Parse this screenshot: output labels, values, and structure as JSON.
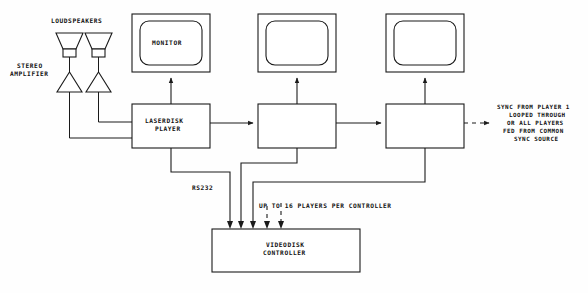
{
  "diagram": {
    "background_color": "#fefefe",
    "line_color": "#1a1a1a",
    "labels": {
      "loudspeakers": "LOUDSPEAKERS",
      "stereo_amplifier_line1": "STEREO",
      "stereo_amplifier_line2": "AMPLIFIER",
      "monitor": "MONITOR",
      "laserdisk_player_line1": "LASERDISK",
      "laserdisk_player_line2": "PLAYER",
      "videodisk_controller_line1": "VIDEODISK",
      "videodisk_controller_line2": "CONTROLLER",
      "rs232": "RS232",
      "players_per_controller": "UP TO 16 PLAYERS PER CONTROLLER",
      "sync_note_line1": "SYNC FROM PLAYER 1",
      "sync_note_line2": "LOOPED THROUGH",
      "sync_note_line3": "OR ALL PLAYERS",
      "sync_note_line4": "FED FROM COMMON",
      "sync_note_line5": "SYNC SOURCE"
    },
    "nodes": {
      "monitor_1": {
        "label": "MONITOR",
        "x": 132,
        "y": 14,
        "w": 78,
        "h": 58
      },
      "monitor_2": {
        "label": "",
        "x": 258,
        "y": 14,
        "w": 78,
        "h": 58
      },
      "monitor_3": {
        "label": "",
        "x": 386,
        "y": 14,
        "w": 78,
        "h": 58
      },
      "player_1": {
        "label": "LASERDISK PLAYER",
        "x": 132,
        "y": 104,
        "w": 78,
        "h": 44
      },
      "player_2": {
        "label": "",
        "x": 258,
        "y": 104,
        "w": 78,
        "h": 44
      },
      "player_3": {
        "label": "",
        "x": 386,
        "y": 104,
        "w": 78,
        "h": 44
      },
      "controller": {
        "label": "VIDEODISK CONTROLLER",
        "x": 212,
        "y": 229,
        "w": 148,
        "h": 43
      },
      "speaker_left": {
        "label": "loudspeaker",
        "x": 63,
        "y": 27
      },
      "speaker_right": {
        "label": "loudspeaker",
        "x": 92,
        "y": 27
      },
      "amp_left": {
        "label": "amplifier",
        "x": 63,
        "y": 62
      },
      "amp_right": {
        "label": "amplifier",
        "x": 92,
        "y": 62
      }
    }
  }
}
